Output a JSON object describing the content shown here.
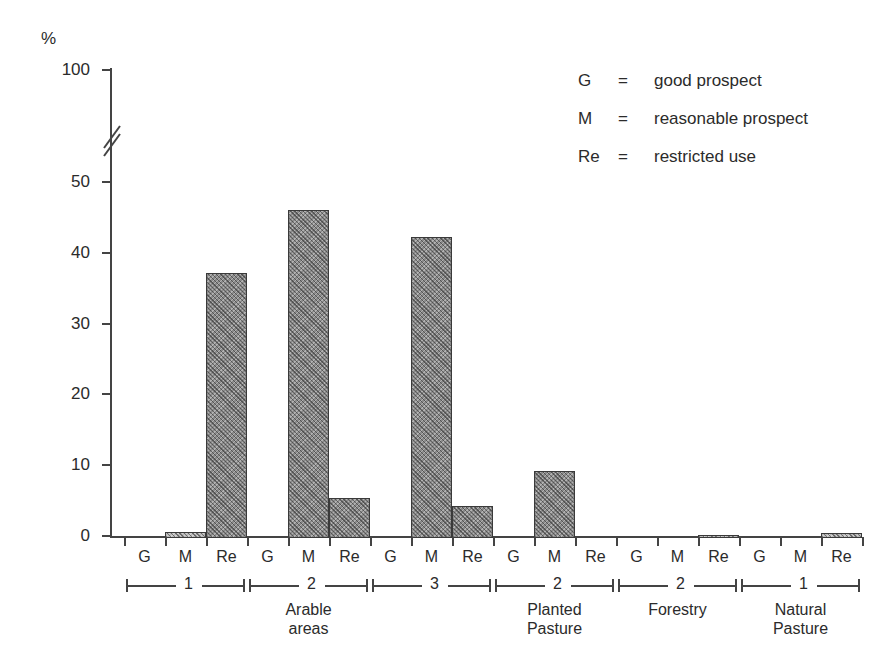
{
  "chart_data": {
    "type": "bar",
    "title": "",
    "xlabel": "",
    "ylabel": "%",
    "ylim": [
      0,
      100
    ],
    "yticks": [
      0,
      10,
      20,
      30,
      40,
      50,
      100
    ],
    "ytick_labels": [
      "0",
      "10",
      "20",
      "30",
      "40",
      "50",
      "100"
    ],
    "axis_break": true,
    "axis_break_between": [
      50,
      100
    ],
    "grid": false,
    "legend_position": "upper-right",
    "categories": [
      "G",
      "M",
      "Re"
    ],
    "groups": [
      {
        "number": "1",
        "region": "Arable areas",
        "bars": [
          {
            "category": "G",
            "value": 0
          },
          {
            "category": "M",
            "value": 0.8
          },
          {
            "category": "Re",
            "value": 37.5
          }
        ]
      },
      {
        "number": "2",
        "region": "Arable areas",
        "bars": [
          {
            "category": "G",
            "value": 0
          },
          {
            "category": "M",
            "value": 46.3
          },
          {
            "category": "Re",
            "value": 5.7
          }
        ]
      },
      {
        "number": "3",
        "region": "Arable areas",
        "bars": [
          {
            "category": "G",
            "value": 0
          },
          {
            "category": "M",
            "value": 42.5
          },
          {
            "category": "Re",
            "value": 4.5
          }
        ]
      },
      {
        "number": "2",
        "region": "Planted Pasture",
        "bars": [
          {
            "category": "G",
            "value": 0
          },
          {
            "category": "M",
            "value": 9.5
          },
          {
            "category": "Re",
            "value": 0
          }
        ]
      },
      {
        "number": "2",
        "region": "Forestry",
        "bars": [
          {
            "category": "G",
            "value": 0
          },
          {
            "category": "M",
            "value": 0
          },
          {
            "category": "Re",
            "value": 0.4
          }
        ]
      },
      {
        "number": "1",
        "region": "Natural Pasture",
        "bars": [
          {
            "category": "G",
            "value": 0
          },
          {
            "category": "M",
            "value": 0
          },
          {
            "category": "Re",
            "value": 0.7
          }
        ]
      }
    ],
    "region_labels": [
      "Arable areas",
      "Planted Pasture",
      "Forestry",
      "Natural Pasture"
    ],
    "legend": [
      {
        "key": "G",
        "eq": "=",
        "text": "good prospect"
      },
      {
        "key": "M",
        "eq": "=",
        "text": "reasonable prospect"
      },
      {
        "key": "Re",
        "eq": "=",
        "text": "restricted use"
      }
    ],
    "colors": {
      "bar_fill": "#8a8a8a",
      "bar_fill_light": "#b9b9b9",
      "bar_stroke": "#3a3a3a",
      "axis": "#444444",
      "text": "#2b2b2b",
      "background": "#ffffff"
    }
  }
}
